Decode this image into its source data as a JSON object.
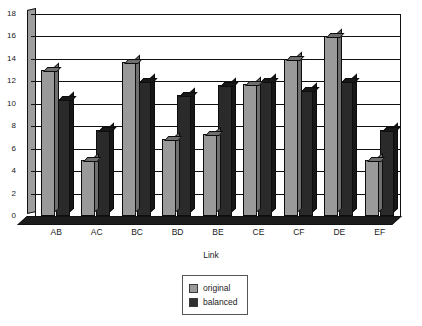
{
  "chart_data": {
    "type": "bar",
    "title": "",
    "xlabel": "Link",
    "ylabel": "",
    "ylim": [
      0,
      18
    ],
    "ytick_step": 2,
    "yticks": [
      0,
      2,
      4,
      6,
      8,
      10,
      12,
      14,
      16,
      18
    ],
    "grid": true,
    "legend_position": "bottom-center",
    "categories": [
      "AB",
      "AC",
      "BC",
      "BD",
      "BE",
      "CE",
      "CF",
      "DE",
      "EF"
    ],
    "series": [
      {
        "name": "original",
        "color": "#9a9a9a",
        "values": [
          13,
          5,
          13.7,
          6.9,
          7.3,
          11.8,
          14,
          16,
          5
        ]
      },
      {
        "name": "balanced",
        "color": "#2a2a2a",
        "values": [
          10.4,
          7.7,
          12,
          10.8,
          11.7,
          12,
          11.2,
          12,
          7.7
        ]
      }
    ]
  },
  "axes": {
    "x_label": "Link"
  },
  "legend": {
    "entries": [
      {
        "label": "original",
        "swatch": "original"
      },
      {
        "label": "balanced",
        "swatch": "balanced"
      }
    ]
  }
}
